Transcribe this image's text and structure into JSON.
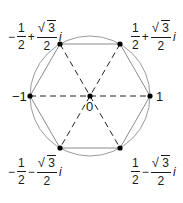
{
  "diagram": {
    "type": "sixth-roots-of-unity",
    "circle": {
      "cx": 90,
      "cy": 96,
      "r": 60,
      "stroke": "#9a9a9a"
    },
    "hexagon": {
      "stroke": "#8c8c8c"
    },
    "spokes": {
      "stroke": "#222222",
      "style": "dashed"
    },
    "point_color": "#000000",
    "center_label": "0",
    "labels": {
      "neg_one": "−1",
      "one": "1",
      "top_left": {
        "sign": "−",
        "num": "1",
        "den": "2",
        "op": "+",
        "sqrt_num": "3",
        "sqrt_den": "2",
        "imag": "i"
      },
      "top_right": {
        "sign": "",
        "num": "1",
        "den": "2",
        "op": "+",
        "sqrt_num": "3",
        "sqrt_den": "2",
        "imag": "i"
      },
      "bottom_left": {
        "sign": "−",
        "num": "1",
        "den": "2",
        "op": "−",
        "sqrt_num": "3",
        "sqrt_den": "2",
        "imag": "i"
      },
      "bottom_right": {
        "sign": "",
        "num": "1",
        "den": "2",
        "op": "−",
        "sqrt_num": "3",
        "sqrt_den": "2",
        "imag": "i"
      }
    },
    "radical_glyph": "√",
    "vertices": [
      {
        "name": "one",
        "x": 150,
        "y": 96
      },
      {
        "name": "top_right",
        "x": 120,
        "y": 44
      },
      {
        "name": "top_left",
        "x": 60,
        "y": 44
      },
      {
        "name": "neg_one",
        "x": 30,
        "y": 96
      },
      {
        "name": "bottom_left",
        "x": 60,
        "y": 148
      },
      {
        "name": "bottom_right",
        "x": 120,
        "y": 148
      }
    ]
  }
}
